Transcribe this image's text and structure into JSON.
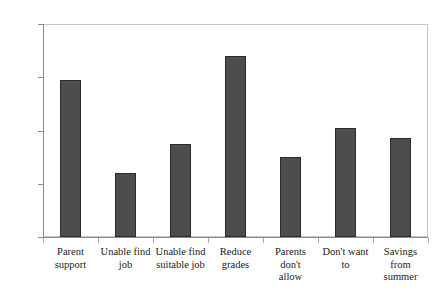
{
  "chart_data": {
    "type": "bar",
    "title": "",
    "subtitle": "",
    "xlabel": "",
    "ylabel": "",
    "ylim": [
      0,
      80
    ],
    "yticks": [
      0,
      20,
      40,
      60,
      80
    ],
    "grid": false,
    "legend": null,
    "bar_color": "#4d4d4d",
    "bar_edge_color": "#2b2b2b",
    "frame_color": "#c9c9c9",
    "axis_color": "#8a8a8a",
    "categories": [
      "Parent support",
      "Unable find job",
      "Unable find suitable job",
      "Reduce grades",
      "Parents don't allow",
      "Don't want to",
      "Savings from summer"
    ],
    "category_lines": [
      [
        "Parent",
        "support"
      ],
      [
        "Unable find",
        "job"
      ],
      [
        "Unable find",
        "suitable job"
      ],
      [
        "Reduce",
        "grades"
      ],
      [
        "Parents don't",
        "allow"
      ],
      [
        "Don't want",
        "to"
      ],
      [
        "Savings",
        "from",
        "summer"
      ]
    ],
    "values": [
      59,
      24,
      35,
      68,
      30,
      41,
      37
    ]
  }
}
